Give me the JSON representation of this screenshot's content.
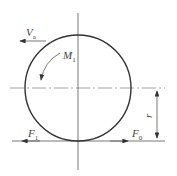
{
  "diagram": {
    "labels": {
      "velocity": {
        "main": "V",
        "sub": "a"
      },
      "moment": {
        "main": "M",
        "sub": "1"
      },
      "friction_force": {
        "main": "F",
        "sub": "1"
      },
      "driving_force": {
        "main": "F",
        "sub": "0"
      },
      "radius": {
        "main": "r",
        "sub": ""
      }
    },
    "colors": {
      "stroke": "#333333",
      "text": "#444444"
    }
  }
}
